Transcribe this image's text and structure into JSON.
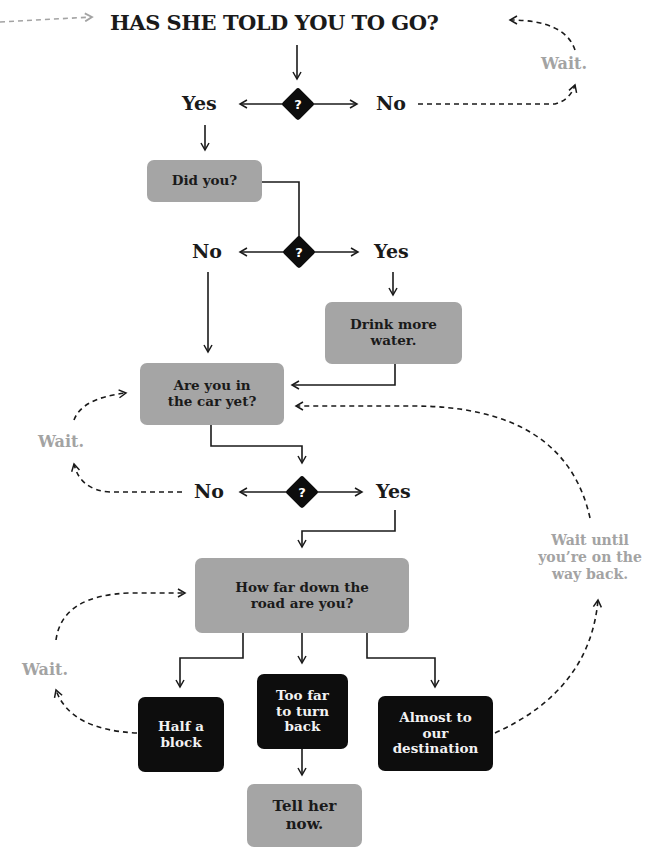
{
  "title": "HAS SHE TOLD YOU TO GO?",
  "decisions": [
    {
      "symbol": "?",
      "yes": "Yes",
      "no": "No"
    },
    {
      "symbol": "?",
      "yes": "Yes",
      "no": "No"
    },
    {
      "symbol": "?",
      "yes": "Yes",
      "no": "No"
    }
  ],
  "boxes": {
    "did_you": "Did you?",
    "drink_water": "Drink more water.",
    "in_car": "Are you in the car yet?",
    "how_far": "How far down the road are you?",
    "half_block": "Half a block",
    "too_far": "Too far to turn back",
    "almost": "Almost to our destination",
    "tell_her": "Tell her now."
  },
  "waits": {
    "top": "Wait.",
    "middle": "Wait.",
    "bottom": "Wait.",
    "way_back": "Wait until you’re on the way back."
  },
  "colors": {
    "grey_box": "#a5a5a5",
    "black_box": "#0d0d0d",
    "wait_text": "#a3a3a3",
    "line": "#1a1a1a"
  }
}
